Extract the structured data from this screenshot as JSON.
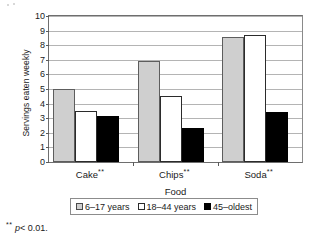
{
  "chart_data": {
    "type": "bar",
    "title": "",
    "xlabel": "Food",
    "ylabel": "Servings eaten weekly",
    "categories": [
      "Cake**",
      "Chips**",
      "Soda**"
    ],
    "category_labels_plain": [
      "Cake",
      "Chips",
      "Soda"
    ],
    "category_significance_marks": [
      "**",
      "**",
      "**"
    ],
    "series": [
      {
        "name": "6–17 years",
        "values": [
          5.0,
          6.9,
          8.55
        ],
        "color": "#cfcfcf"
      },
      {
        "name": "18–44 years",
        "values": [
          3.5,
          4.5,
          8.7
        ],
        "color": "#ffffff"
      },
      {
        "name": "45–oldest",
        "values": [
          3.15,
          2.3,
          3.4
        ],
        "color": "#000000"
      }
    ],
    "ylim": [
      0,
      10
    ],
    "ytick_step": 1,
    "yticks": [
      10,
      9,
      8,
      7,
      6,
      5,
      4,
      3,
      2,
      1,
      0
    ],
    "grid": true,
    "grid_axis": "y",
    "legend_position": "bottom"
  },
  "axes": {
    "y_title": "Servings eaten weekly",
    "x_title": "Food",
    "y_tick_labels": [
      "10",
      "9",
      "8",
      "7",
      "6",
      "5",
      "4",
      "3",
      "2",
      "1",
      "0"
    ]
  },
  "legend": {
    "items": [
      {
        "label": "6–17 years",
        "swatch": "legend-swatch-gray"
      },
      {
        "label": "18–44 years",
        "swatch": "legend-swatch-white"
      },
      {
        "label": "45–oldest",
        "swatch": "legend-swatch-black"
      }
    ]
  },
  "footnote": {
    "marks": "**",
    "variable": "p",
    "text": "< 0.01."
  }
}
